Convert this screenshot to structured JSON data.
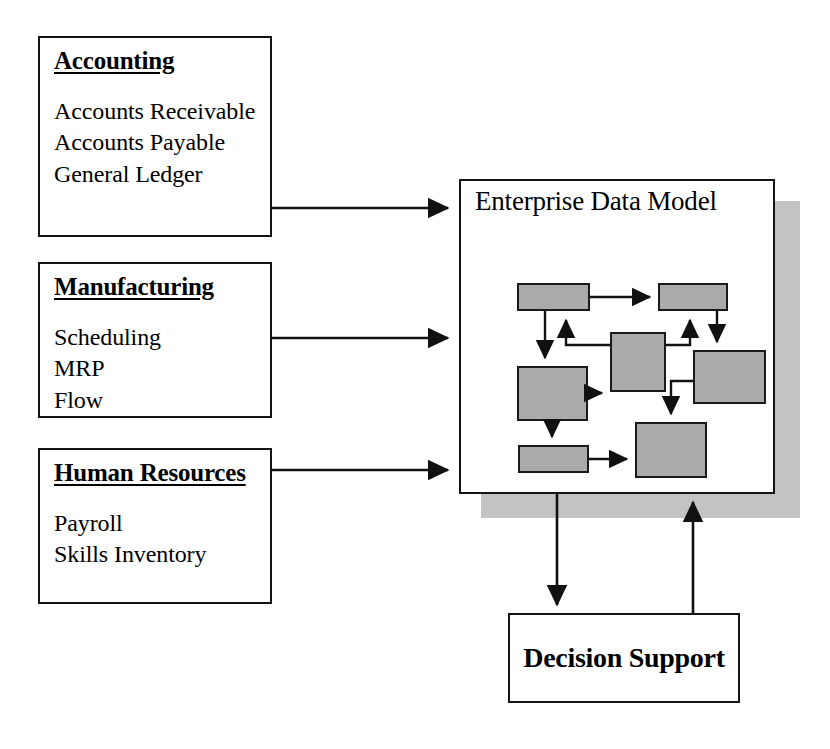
{
  "diagram": {
    "colors": {
      "box_fill": "#ffffff",
      "box_border": "#141414",
      "inner_box_fill": "#aaaaaa",
      "shadow": "#c3c3c3",
      "text": "#000000"
    }
  },
  "modules": [
    {
      "id": "accounting",
      "title": "Accounting",
      "items": [
        "Accounts Receivable",
        "Accounts Payable",
        "General Ledger"
      ]
    },
    {
      "id": "manufacturing",
      "title": "Manufacturing",
      "items": [
        "Scheduling",
        "MRP",
        "Flow"
      ]
    },
    {
      "id": "human-resources",
      "title": "Human Resources",
      "items": [
        "Payroll",
        "Skills Inventory"
      ]
    }
  ],
  "enterprise_data_model": {
    "title": "Enterprise Data Model",
    "inner_boxes": [
      {
        "id": "entity-1",
        "x": 517,
        "y": 283,
        "w": 73,
        "h": 28
      },
      {
        "id": "entity-2",
        "x": 658,
        "y": 283,
        "w": 70,
        "h": 28
      },
      {
        "id": "entity-3",
        "x": 610,
        "y": 332,
        "w": 56,
        "h": 60
      },
      {
        "id": "entity-4",
        "x": 693,
        "y": 350,
        "w": 73,
        "h": 54
      },
      {
        "id": "entity-5",
        "x": 517,
        "y": 366,
        "w": 71,
        "h": 55
      },
      {
        "id": "entity-6",
        "x": 518,
        "y": 445,
        "w": 71,
        "h": 28
      },
      {
        "id": "entity-7",
        "x": 635,
        "y": 422,
        "w": 72,
        "h": 56
      }
    ]
  },
  "decision_support": {
    "title": "Decision Support"
  },
  "connections": [
    {
      "id": "accounting-to-edm",
      "from": "accounting",
      "to": "enterprise-data-model"
    },
    {
      "id": "manufacturing-to-edm",
      "from": "manufacturing",
      "to": "enterprise-data-model"
    },
    {
      "id": "hr-to-edm",
      "from": "human-resources",
      "to": "enterprise-data-model"
    },
    {
      "id": "edm-to-decision-support",
      "from": "enterprise-data-model",
      "to": "decision-support"
    },
    {
      "id": "decision-support-to-edm",
      "from": "decision-support",
      "to": "enterprise-data-model"
    }
  ]
}
